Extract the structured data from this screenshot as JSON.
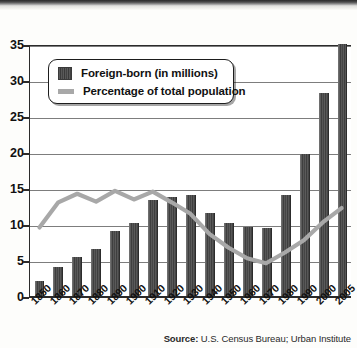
{
  "chart_data": {
    "type": "bar",
    "title": "",
    "subtitle": "",
    "xlabel": "",
    "ylabel": "",
    "ylim": [
      0,
      35
    ],
    "yticks": [
      0,
      5,
      10,
      15,
      20,
      25,
      30,
      35
    ],
    "grid": true,
    "legend_position": "upper-left-inset",
    "categories": [
      "1850",
      "1860",
      "1870",
      "1880",
      "1890",
      "1900",
      "1910",
      "1920",
      "1930",
      "1940",
      "1950",
      "1960",
      "1970",
      "1980",
      "1990",
      "2000",
      "2005"
    ],
    "series": [
      {
        "name": "Foreign-born (in millions)",
        "type": "bar",
        "color": "#4a4a4a",
        "values": [
          2.2,
          4.1,
          5.6,
          6.7,
          9.2,
          10.3,
          13.5,
          13.9,
          14.2,
          11.6,
          10.3,
          9.7,
          9.6,
          14.1,
          19.8,
          28.4,
          35.2
        ]
      },
      {
        "name": "Percentage of total population",
        "type": "line",
        "color": "#a8a8a8",
        "values": [
          9.7,
          13.2,
          14.4,
          13.3,
          14.8,
          13.6,
          14.7,
          13.2,
          11.6,
          8.8,
          6.9,
          5.4,
          4.7,
          6.2,
          7.9,
          10.4,
          12.4
        ]
      }
    ],
    "source_prefix": "Source:",
    "source_text": " U.S. Census Bureau; Urban Institute"
  },
  "legend": {
    "items": [
      {
        "label": "Foreign-born (in millions)",
        "marker": "bar-swatch-icon"
      },
      {
        "label": "Percentage of total population",
        "marker": "line-swatch-icon"
      }
    ]
  }
}
